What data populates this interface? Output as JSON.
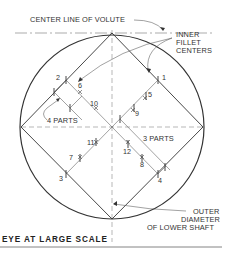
{
  "diagram": {
    "title": "EYE AT LARGE SCALE",
    "labels": {
      "center_line": "CENTER LINE OF VOLUTE",
      "inner_fillet_1": "INNER",
      "inner_fillet_2": "FILLET",
      "inner_fillet_3": "CENTERS",
      "four_parts": "4 PARTS",
      "three_parts": "3 PARTS",
      "outer_1": "OUTER",
      "outer_2": "DIAMETER",
      "outer_3": "OF LOWER SHAFT"
    },
    "points": {
      "p1": "1",
      "p2": "2",
      "p3": "3",
      "p4": "4",
      "p5": "5",
      "p6": "6",
      "p7": "7",
      "p8": "8",
      "p9": "9",
      "p10": "10",
      "p11": "11",
      "p12": "12"
    },
    "colors": {
      "line": "#333333",
      "construction": "#999999",
      "background": "#ffffff"
    }
  }
}
